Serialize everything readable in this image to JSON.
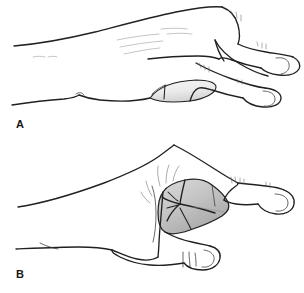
{
  "figure": {
    "background_color": "#ffffff",
    "width": 304,
    "height": 293,
    "style": "medical line-art illustration, lateral view of a hand"
  },
  "panels": [
    {
      "id": "A",
      "label": "A",
      "label_x": 16,
      "label_y": 128,
      "description": "hand with fingers extended, thumb relaxed, first web space shaded light gray",
      "shaded_region": {
        "name": "first-web-space-relaxed",
        "fill_light": "#f3f3f3",
        "fill_dark": "#d6d6d6",
        "stroke": "#231f20"
      }
    },
    {
      "id": "B",
      "label": "B",
      "label_x": 16,
      "label_y": 278,
      "description": "hand with thumb adducted and flexed, first web space skin bunched and shaded darker gray with crease lines",
      "shaded_region": {
        "name": "first-web-space-adducted",
        "fill_light": "#dcdcdc",
        "fill_dark": "#a8a8a8",
        "stroke": "#231f20"
      }
    }
  ],
  "colors": {
    "ink": "#231f20",
    "ink_fine": "#3a3638",
    "ink_hair": "#6a6467",
    "ink_faint": "#8d888b",
    "paper": "#ffffff"
  }
}
